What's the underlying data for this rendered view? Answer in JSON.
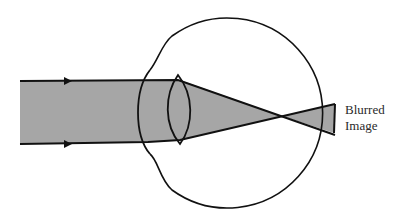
{
  "diagram": {
    "labels": {
      "blurred_line1": "Blurred",
      "blurred_line2": "Image"
    },
    "colors": {
      "background": "#ffffff",
      "stroke": "#111111",
      "beam_fill": "#a6a6a6"
    },
    "elements": [
      "light-beam",
      "direction-arrows",
      "eyeball",
      "cornea",
      "lens",
      "focal-crossing",
      "retina-blur"
    ]
  }
}
